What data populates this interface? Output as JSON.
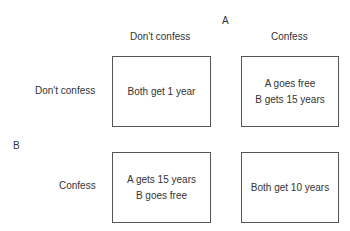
{
  "player_a_label": "A",
  "player_b_label": "B",
  "column_headers": [
    "Don't confess",
    "Confess"
  ],
  "row_headers": [
    "Don't confess",
    "Confess"
  ],
  "cells": [
    [
      [
        "Both get 1 year"
      ],
      [
        "A goes free",
        "B gets 15 years"
      ]
    ],
    [
      [
        "A gets 15 years",
        "B goes free"
      ],
      [
        "Both get 10 years"
      ]
    ]
  ]
}
